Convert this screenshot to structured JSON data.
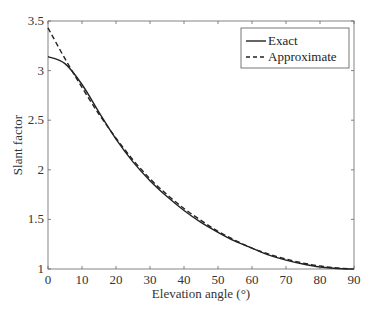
{
  "chart_data": {
    "type": "line",
    "title": "",
    "xlabel": "Elevation angle (°)",
    "ylabel": "Slant factor",
    "xlim": [
      0,
      90
    ],
    "ylim": [
      1,
      3.5
    ],
    "xticks": [
      0,
      10,
      20,
      30,
      40,
      50,
      60,
      70,
      80,
      90
    ],
    "yticks": [
      1,
      1.5,
      2,
      2.5,
      3,
      3.5
    ],
    "xtick_labels": [
      "0",
      "10",
      "20",
      "30",
      "40",
      "50",
      "60",
      "70",
      "80",
      "90"
    ],
    "ytick_labels": [
      "1",
      "1.5",
      "2",
      "2.5",
      "3",
      "3.5"
    ],
    "grid": false,
    "legend_position": "upper right",
    "x": [
      0,
      5,
      10,
      15,
      20,
      25,
      30,
      35,
      40,
      45,
      50,
      55,
      60,
      65,
      70,
      75,
      80,
      85,
      90
    ],
    "series": [
      {
        "name": "Exact",
        "style": "solid",
        "values": [
          3.14,
          3.07,
          2.86,
          2.58,
          2.31,
          2.08,
          1.89,
          1.73,
          1.59,
          1.47,
          1.37,
          1.28,
          1.21,
          1.14,
          1.09,
          1.05,
          1.02,
          1.005,
          1.0
        ]
      },
      {
        "name": "Approximate",
        "style": "dashed",
        "values": [
          3.43,
          3.12,
          2.83,
          2.56,
          2.32,
          2.1,
          1.91,
          1.75,
          1.61,
          1.49,
          1.38,
          1.29,
          1.21,
          1.15,
          1.1,
          1.06,
          1.03,
          1.01,
          1.0
        ]
      }
    ]
  },
  "legend": {
    "items": [
      {
        "label": "Exact"
      },
      {
        "label": "Approximate"
      }
    ]
  }
}
